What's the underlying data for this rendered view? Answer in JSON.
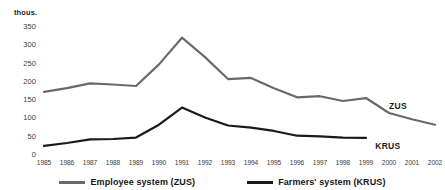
{
  "chart_data": {
    "type": "line",
    "title": "",
    "xlabel": "",
    "ylabel": "thous.",
    "unit_label": "thous.",
    "ylim": [
      0,
      350
    ],
    "ytick_values": [
      350,
      300,
      250,
      200,
      150,
      100,
      50,
      0
    ],
    "ytick_labels": [
      "350",
      "300",
      "250",
      "200",
      "150",
      "100",
      "50",
      "0"
    ],
    "grid": false,
    "legend_position": "bottom",
    "x": [
      1985,
      1986,
      1987,
      1988,
      1989,
      1990,
      1991,
      1992,
      1993,
      1994,
      1995,
      1996,
      1997,
      1998,
      1999,
      2000,
      2001,
      2002
    ],
    "xtick_labels": [
      "1985",
      "1986",
      "1987",
      "1988",
      "1989",
      "1990",
      "1991",
      "1992",
      "1993",
      "1994",
      "1995",
      "1996",
      "1997",
      "1998",
      "1999",
      "2000",
      "2001",
      "2002"
    ],
    "series": [
      {
        "name": "Employee system (ZUS)",
        "short_name": "ZUS",
        "color": "#6a6a6a",
        "values": [
          170,
          180,
          193,
          190,
          186,
          245,
          318,
          265,
          205,
          208,
          180,
          155,
          158,
          145,
          153,
          112,
          95,
          80
        ]
      },
      {
        "name": "Farmers' system (KRUS)",
        "short_name": "KRUS",
        "color": "#1a1a1a",
        "values": [
          22,
          30,
          40,
          41,
          45,
          80,
          127,
          100,
          78,
          72,
          63,
          50,
          48,
          45,
          44,
          null,
          null,
          null
        ]
      }
    ],
    "annotations": [
      {
        "text": "ZUS",
        "x": 2000,
        "y": 128
      },
      {
        "text": "KRUS",
        "x": 1999.4,
        "y": 20
      }
    ]
  },
  "legend": {
    "items": [
      {
        "label": "Employee system (ZUS)",
        "color": "#6a6a6a"
      },
      {
        "label": "Farmers' system (KRUS)",
        "color": "#1a1a1a"
      }
    ]
  }
}
